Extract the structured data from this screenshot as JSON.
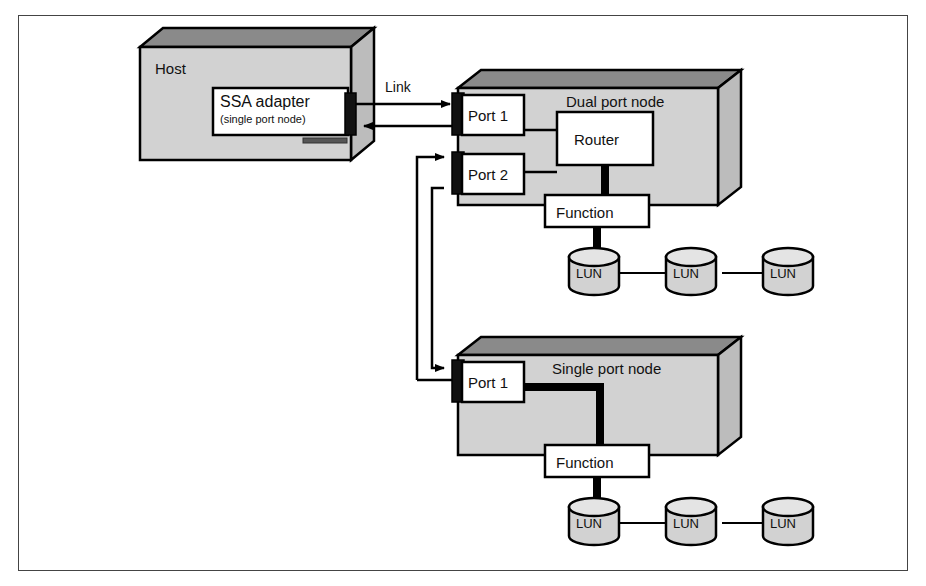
{
  "diagram": {
    "frame": {
      "border_color": "#444444"
    },
    "colors": {
      "box_front": "#d2d2d2",
      "box_top": "#8a8a8a",
      "box_side": "#c0c0c0",
      "outline": "#000000",
      "white_box": "#ffffff",
      "connector": "#000000"
    },
    "host": {
      "label": "Host",
      "adapter": {
        "title": "SSA adapter",
        "subtitle": "(single port node)"
      }
    },
    "link": {
      "label": "Link"
    },
    "dual_port_node": {
      "label": "Dual port node",
      "ports": [
        {
          "label": "Port 1"
        },
        {
          "label": "Port 2"
        }
      ],
      "router": {
        "label": "Router"
      },
      "function": {
        "label": "Function"
      },
      "luns": [
        {
          "label": "LUN"
        },
        {
          "label": "LUN"
        },
        {
          "label": "LUN"
        }
      ]
    },
    "single_port_node": {
      "label": "Single port node",
      "ports": [
        {
          "label": "Port 1"
        }
      ],
      "function": {
        "label": "Function"
      },
      "luns": [
        {
          "label": "LUN"
        },
        {
          "label": "LUN"
        },
        {
          "label": "LUN"
        }
      ]
    }
  }
}
